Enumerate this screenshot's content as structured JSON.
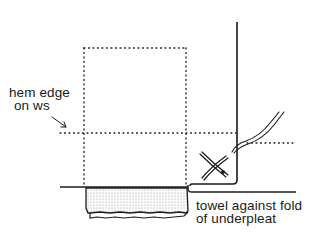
{
  "diagram": {
    "labels": {
      "hem_edge": {
        "line1": "hem edge",
        "line2": "on ws"
      },
      "towel": {
        "line1": "towel against fold",
        "line2": "of underpleat"
      }
    },
    "colors": {
      "ink": "#1a1a1a",
      "towel_fill": "#e6e6e6"
    }
  }
}
